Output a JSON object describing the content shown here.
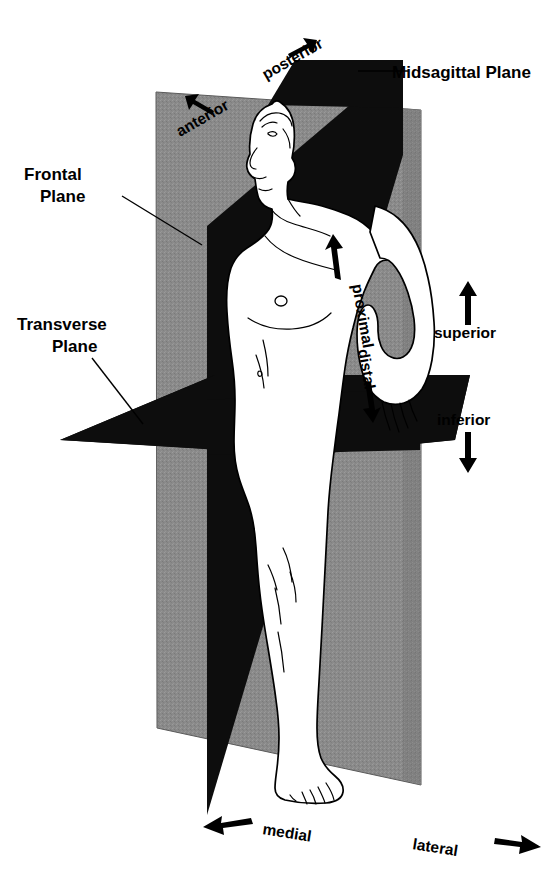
{
  "colors": {
    "frontal_plane_gray": "#8a8a8a",
    "frontal_plane_gray_dark": "#7b7b7b",
    "sagittal_plane_black": "#0d0d0d",
    "transverse_plane_black": "#0d0d0d",
    "body_fill": "#ffffff",
    "outline": "#000000",
    "leader_line": "#000000"
  },
  "plane_labels": [
    {
      "id": "midsagittal",
      "text": "Midsagittal Plane",
      "position": "top-right",
      "has_leader": true
    },
    {
      "id": "frontal",
      "text": "Frontal\nPlane",
      "line1": "Frontal",
      "line2": "Plane",
      "position": "left-upper",
      "has_leader": true
    },
    {
      "id": "transverse",
      "text": "Transverse\nPlane",
      "line1": "Transverse",
      "line2": "Plane",
      "position": "left-lower",
      "has_leader": true
    }
  ],
  "direction_labels": [
    {
      "id": "posterior",
      "text": "posterior",
      "arrow": "up-right",
      "rotation": -27
    },
    {
      "id": "anterior",
      "text": "anterior",
      "arrow": "down-left",
      "rotation": -27
    },
    {
      "id": "proximal",
      "text": "proximal",
      "arrow": "up",
      "rotation": 80
    },
    {
      "id": "distal",
      "text": "distal",
      "arrow": "down",
      "rotation": 80
    },
    {
      "id": "superior",
      "text": "superior",
      "arrow": "up",
      "rotation": 0
    },
    {
      "id": "inferior",
      "text": "inferior",
      "arrow": "down",
      "rotation": 0
    },
    {
      "id": "medial",
      "text": "medial",
      "arrow": "left",
      "rotation": 8
    },
    {
      "id": "lateral",
      "text": "lateral",
      "arrow": "right",
      "rotation": 8
    }
  ],
  "labels": {
    "midsagittal_plane": "Midsagittal Plane",
    "frontal_plane_l1": "Frontal",
    "frontal_plane_l2": "Plane",
    "transverse_plane_l1": "Transverse",
    "transverse_plane_l2": "Plane",
    "posterior": "posterior",
    "anterior": "anterior",
    "proximal": "proximal",
    "distal": "distal",
    "superior": "superior",
    "inferior": "inferior",
    "medial": "medial",
    "lateral": "lateral"
  }
}
